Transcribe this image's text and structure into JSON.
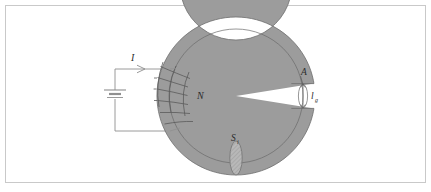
{
  "figure": {
    "background_color": "#ffffff",
    "border_color": "#c9c9c9"
  },
  "colors": {
    "core_fill": "#9c9c9c",
    "core_stroke": "#6f6f6f",
    "mean_path_line": "#6a6a6a",
    "wire": "#8a8a8a",
    "coil": "#5c5c5c",
    "label_text": "#2b2b2b",
    "section_fill": "#b4b4b4"
  },
  "labels": {
    "current": "I",
    "turns": "N",
    "gap_length": "l",
    "gap_length_sub": "g",
    "gap_area": "A",
    "core_section": "S",
    "core_section_sub": "i"
  },
  "geometry": {
    "center_x": 236,
    "center_y": 96,
    "outer_radius": 79,
    "inner_radius": 56,
    "mean_radius": 67,
    "gap_half_angle_deg": 9,
    "gap_center_angle_deg": 0
  },
  "source": {
    "type": "battery",
    "terminal_note": "dc source driving coil current"
  },
  "annotations": [
    {
      "name": "current-arrow",
      "label": "I",
      "description": "arrow on top lead showing current direction into coil"
    },
    {
      "name": "turns-label",
      "label": "N",
      "description": "number of coil turns wound on core"
    },
    {
      "name": "gap-length-label",
      "label": "lg",
      "description": "air gap length across the core break"
    },
    {
      "name": "gap-area-label",
      "label": "A",
      "description": "air gap cross-sectional area"
    },
    {
      "name": "core-section-label",
      "label": "Si",
      "description": "core cross-sectional area at bottom of toroid"
    }
  ]
}
